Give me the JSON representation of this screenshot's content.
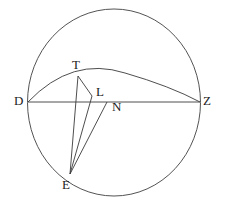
{
  "figure": {
    "background_color": "#ffffff",
    "stroke_color": "#3a3a3a",
    "label_color": "#1b1b1b",
    "width": 226,
    "height": 207,
    "circle": {
      "center_x": 114,
      "center_y": 102.5,
      "radius_x": 86.5,
      "radius_y": 93.5
    },
    "points": [
      {
        "id": "D",
        "label": "D",
        "x": 28,
        "y": 102,
        "label_x": 14,
        "label_y": 94
      },
      {
        "id": "T",
        "label": "T",
        "x": 78,
        "y": 76,
        "label_x": 72,
        "label_y": 58
      },
      {
        "id": "L",
        "label": "L",
        "x": 92,
        "y": 96,
        "label_x": 96,
        "label_y": 85
      },
      {
        "id": "N",
        "label": "N",
        "x": 107,
        "y": 102,
        "label_x": 112,
        "label_y": 100
      },
      {
        "id": "Z",
        "label": "Z",
        "x": 200,
        "y": 102,
        "label_x": 203,
        "label_y": 94
      },
      {
        "id": "E",
        "label": "E",
        "x": 70,
        "y": 174,
        "label_x": 62,
        "label_y": 178
      }
    ],
    "segments": [
      {
        "id": "DZ",
        "from": "D",
        "to": "Z",
        "kind": "chord"
      },
      {
        "id": "ET",
        "from": "E",
        "to": "T",
        "kind": "cevian"
      },
      {
        "id": "EL",
        "from": "E",
        "to": "L",
        "kind": "cevian"
      },
      {
        "id": "EN",
        "from": "E",
        "to": "N",
        "kind": "cevian"
      },
      {
        "id": "TL",
        "from": "T",
        "to": "L",
        "kind": "connector"
      }
    ],
    "arcs": [
      {
        "id": "DTZ",
        "from": "D",
        "to": "Z",
        "apex_x": 125,
        "apex_y": 73,
        "kind": "upper-arc"
      }
    ]
  }
}
